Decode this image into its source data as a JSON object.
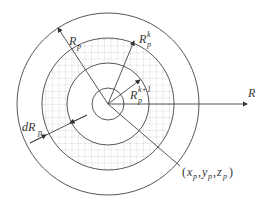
{
  "diagram": {
    "center": {
      "x": 108,
      "y": 104
    },
    "circles": {
      "outer_radius": 91,
      "grid_radius": 66,
      "inner_white_radius": 41,
      "core_radius": 16
    },
    "colors": {
      "stroke": "#444444",
      "grid": "#9a9a9a",
      "text": "#333333"
    },
    "labels": {
      "R_axis": "R",
      "Rp_base": "R",
      "Rp_sub": "p",
      "Rpk_base": "R",
      "Rpk_sup": "k",
      "Rpk_sub": "p",
      "Rpk1_base": "R",
      "Rpk1_sup": "k+1",
      "Rpk1_sub": "p",
      "dRp_base": "dR",
      "dRp_sub": "p",
      "point_open": "(",
      "point_x": "x",
      "point_y": "y",
      "point_z": "z",
      "point_sub": "p",
      "point_comma": ",",
      "point_close": ")"
    }
  }
}
